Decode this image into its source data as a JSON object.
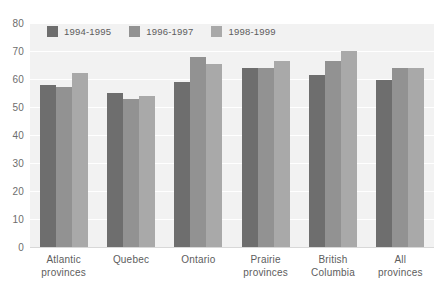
{
  "chart_data": {
    "type": "bar",
    "title": "",
    "subtitle": "",
    "xlabel": "",
    "ylabel": "",
    "ylim": [
      0,
      80
    ],
    "ytick_step": 10,
    "yticks": [
      "80",
      "70",
      "60",
      "50",
      "40",
      "30",
      "20",
      "10",
      "0"
    ],
    "grid": true,
    "legend_position": "top-left-inside",
    "categories": [
      "Atlantic provinces",
      "Quebec",
      "Ontario",
      "Prairie provinces",
      "British Columbia",
      "All provinces"
    ],
    "category_lines": [
      [
        "Atlantic",
        "provinces"
      ],
      [
        "Quebec",
        ""
      ],
      [
        "Ontario",
        ""
      ],
      [
        "Prairie",
        "provinces"
      ],
      [
        "British",
        "Columbia"
      ],
      [
        "All",
        "provinces"
      ]
    ],
    "series": [
      {
        "name": "1994-1995",
        "color": "#6e6e6e",
        "values": [
          58,
          55,
          59,
          64,
          61.5,
          59.5
        ]
      },
      {
        "name": "1996-1997",
        "color": "#929292",
        "values": [
          57,
          53,
          68,
          64,
          66.5,
          64
        ]
      },
      {
        "name": "1998-1999",
        "color": "#a9a9a9",
        "values": [
          62,
          54,
          65.5,
          66.5,
          70,
          64
        ]
      }
    ]
  },
  "colors": {
    "plot_background": "#f2f2f2",
    "page_background": "#ffffff",
    "gridline": "#ffffff",
    "tick_text": "#6d6d6d",
    "label_text": "#5d5d5d"
  }
}
